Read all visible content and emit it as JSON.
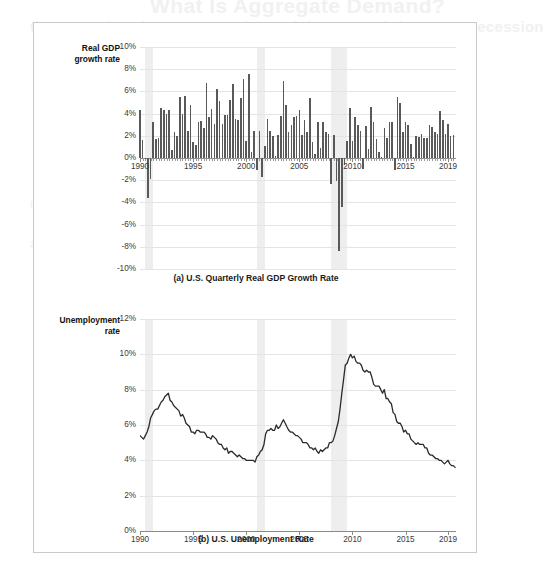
{
  "page": {
    "bleed_through_text": {
      "title": "What Is Aggregate Demand?",
      "line1": "the same drop in aggregate demand that caused the Great Recession",
      "line2": "recession in output and a sharp rise in unemployment",
      "line3": "aggregate demand shifted left during the downturn"
    }
  },
  "figure": {
    "panels": [
      {
        "id": "gdp",
        "caption": "(a) U.S. Quarterly Real GDP Growth Rate",
        "axis_title": "Real GDP\ngrowth rate"
      },
      {
        "id": "unemployment",
        "caption": "(b) U.S. Unemployment Rate",
        "axis_title": "Unemployment\nrate"
      }
    ]
  },
  "colors": {
    "bar": "#595959",
    "line": "#2b2b2b",
    "recession_band": "#eeeeee",
    "gridline": "#e4e4e4",
    "axis": "#8a8a8a",
    "frame_border": "#c9c9c9",
    "background": "#ffffff"
  },
  "chart_data": [
    {
      "type": "bar",
      "id": "gdp",
      "title": "(a) U.S. Quarterly Real GDP Growth Rate",
      "xlabel": "",
      "ylabel": "Real GDP growth rate",
      "ylim": [
        -10,
        10
      ],
      "yticks": [
        10,
        8,
        6,
        4,
        2,
        0,
        -2,
        -4,
        -6,
        -8,
        -10
      ],
      "ytick_labels": [
        "10%",
        "8%",
        "6%",
        "4%",
        "2%",
        "0%",
        "-2%",
        "-4%",
        "-6%",
        "-8%",
        "-10%"
      ],
      "xlim": [
        1990,
        2019.75
      ],
      "xticks": [
        1990,
        1995,
        2000,
        2005,
        2010,
        2015,
        2019
      ],
      "xtick_labels": [
        "1990",
        "1995",
        "2000",
        "2005",
        "2010",
        "2015",
        "2019"
      ],
      "grid": true,
      "legend": "none",
      "unit": "percent, annualized quarterly change",
      "recession_bands": [
        {
          "start": 1990.5,
          "end": 1991.25
        },
        {
          "start": 2001.0,
          "end": 2001.75
        },
        {
          "start": 2007.95,
          "end": 2009.45
        }
      ],
      "x": [
        1990.0,
        1990.25,
        1990.5,
        1990.75,
        1991.0,
        1991.25,
        1991.5,
        1991.75,
        1992.0,
        1992.25,
        1992.5,
        1992.75,
        1993.0,
        1993.25,
        1993.5,
        1993.75,
        1994.0,
        1994.25,
        1994.5,
        1994.75,
        1995.0,
        1995.25,
        1995.5,
        1995.75,
        1996.0,
        1996.25,
        1996.5,
        1996.75,
        1997.0,
        1997.25,
        1997.5,
        1997.75,
        1998.0,
        1998.25,
        1998.5,
        1998.75,
        1999.0,
        1999.25,
        1999.5,
        1999.75,
        2000.0,
        2000.25,
        2000.5,
        2000.75,
        2001.0,
        2001.25,
        2001.5,
        2001.75,
        2002.0,
        2002.25,
        2002.5,
        2002.75,
        2003.0,
        2003.25,
        2003.5,
        2003.75,
        2004.0,
        2004.25,
        2004.5,
        2004.75,
        2005.0,
        2005.25,
        2005.5,
        2005.75,
        2006.0,
        2006.25,
        2006.5,
        2006.75,
        2007.0,
        2007.25,
        2007.5,
        2007.75,
        2008.0,
        2008.25,
        2008.5,
        2008.75,
        2009.0,
        2009.25,
        2009.5,
        2009.75,
        2010.0,
        2010.25,
        2010.5,
        2010.75,
        2011.0,
        2011.25,
        2011.5,
        2011.75,
        2012.0,
        2012.25,
        2012.5,
        2012.75,
        2013.0,
        2013.25,
        2013.5,
        2013.75,
        2014.0,
        2014.25,
        2014.5,
        2014.75,
        2015.0,
        2015.25,
        2015.5,
        2015.75,
        2016.0,
        2016.25,
        2016.5,
        2016.75,
        2017.0,
        2017.25,
        2017.5,
        2017.75,
        2018.0,
        2018.25,
        2018.5,
        2018.75,
        2019.0,
        2019.25,
        2019.5
      ],
      "values": [
        4.3,
        1.6,
        0.0,
        -3.6,
        -1.9,
        3.2,
        1.7,
        1.8,
        4.5,
        4.3,
        4.0,
        4.3,
        0.7,
        2.3,
        2.0,
        5.5,
        4.0,
        5.6,
        2.4,
        4.8,
        1.4,
        1.2,
        3.2,
        3.3,
        2.7,
        6.8,
        3.7,
        4.4,
        3.1,
        6.2,
        5.1,
        3.1,
        3.9,
        3.9,
        5.2,
        6.7,
        3.5,
        3.4,
        5.4,
        7.1,
        1.5,
        7.6,
        0.5,
        2.4,
        -1.1,
        2.4,
        -1.7,
        1.1,
        3.5,
        2.4,
        2.0,
        0.2,
        2.1,
        3.8,
        6.9,
        4.8,
        2.3,
        3.0,
        3.7,
        3.8,
        4.3,
        2.1,
        3.4,
        2.3,
        5.4,
        1.4,
        0.4,
        3.2,
        0.9,
        3.2,
        2.3,
        2.2,
        -2.3,
        2.1,
        -2.1,
        -8.4,
        -4.4,
        -0.6,
        1.5,
        4.5,
        1.5,
        3.7,
        3.0,
        2.4,
        -1.0,
        2.9,
        0.8,
        4.6,
        3.2,
        1.7,
        0.5,
        0.1,
        2.7,
        1.8,
        3.2,
        3.2,
        -1.1,
        5.5,
        5.0,
        2.3,
        3.2,
        3.0,
        1.3,
        0.1,
        2.0,
        1.9,
        2.2,
        1.8,
        1.8,
        3.0,
        2.8,
        2.3,
        2.2,
        4.2,
        3.4,
        2.2,
        3.1,
        2.0,
        2.1
      ]
    },
    {
      "type": "line",
      "id": "unemployment",
      "title": "(b) U.S. Unemployment Rate",
      "xlabel": "",
      "ylabel": "Unemployment rate",
      "ylim": [
        0,
        12
      ],
      "yticks": [
        12,
        10,
        8,
        6,
        4,
        2,
        0
      ],
      "ytick_labels": [
        "12%",
        "10%",
        "8%",
        "6%",
        "4%",
        "2%",
        "0%"
      ],
      "xlim": [
        1990,
        2019.75
      ],
      "xticks": [
        1990,
        1995,
        2000,
        2005,
        2010,
        2015,
        2019
      ],
      "xtick_labels": [
        "1990",
        "1995",
        "2000",
        "2005",
        "2010",
        "2015",
        "2019"
      ],
      "grid": true,
      "legend": "none",
      "unit": "percent, monthly",
      "recession_bands": [
        {
          "start": 1990.5,
          "end": 1991.25
        },
        {
          "start": 2001.0,
          "end": 2001.75
        },
        {
          "start": 2007.95,
          "end": 2009.45
        }
      ],
      "x": [
        1990.0,
        1990.17,
        1990.33,
        1990.5,
        1990.67,
        1990.83,
        1991.0,
        1991.17,
        1991.33,
        1991.5,
        1991.67,
        1991.83,
        1992.0,
        1992.17,
        1992.33,
        1992.5,
        1992.67,
        1992.83,
        1993.0,
        1993.17,
        1993.33,
        1993.5,
        1993.67,
        1993.83,
        1994.0,
        1994.17,
        1994.33,
        1994.5,
        1994.67,
        1994.83,
        1995.0,
        1995.17,
        1995.33,
        1995.5,
        1995.67,
        1995.83,
        1996.0,
        1996.17,
        1996.33,
        1996.5,
        1996.67,
        1996.83,
        1997.0,
        1997.17,
        1997.33,
        1997.5,
        1997.67,
        1997.83,
        1998.0,
        1998.17,
        1998.33,
        1998.5,
        1998.67,
        1998.83,
        1999.0,
        1999.17,
        1999.33,
        1999.5,
        1999.67,
        1999.83,
        2000.0,
        2000.17,
        2000.33,
        2000.5,
        2000.67,
        2000.83,
        2001.0,
        2001.17,
        2001.33,
        2001.5,
        2001.67,
        2001.83,
        2002.0,
        2002.17,
        2002.33,
        2002.5,
        2002.67,
        2002.83,
        2003.0,
        2003.17,
        2003.33,
        2003.5,
        2003.67,
        2003.83,
        2004.0,
        2004.17,
        2004.33,
        2004.5,
        2004.67,
        2004.83,
        2005.0,
        2005.17,
        2005.33,
        2005.5,
        2005.67,
        2005.83,
        2006.0,
        2006.17,
        2006.33,
        2006.5,
        2006.67,
        2006.83,
        2007.0,
        2007.17,
        2007.33,
        2007.5,
        2007.67,
        2007.83,
        2008.0,
        2008.17,
        2008.33,
        2008.5,
        2008.67,
        2008.83,
        2009.0,
        2009.17,
        2009.33,
        2009.5,
        2009.67,
        2009.83,
        2010.0,
        2010.17,
        2010.33,
        2010.5,
        2010.67,
        2010.83,
        2011.0,
        2011.17,
        2011.33,
        2011.5,
        2011.67,
        2011.83,
        2012.0,
        2012.17,
        2012.33,
        2012.5,
        2012.67,
        2012.83,
        2013.0,
        2013.17,
        2013.33,
        2013.5,
        2013.67,
        2013.83,
        2014.0,
        2014.17,
        2014.33,
        2014.5,
        2014.67,
        2014.83,
        2015.0,
        2015.17,
        2015.33,
        2015.5,
        2015.67,
        2015.83,
        2016.0,
        2016.17,
        2016.33,
        2016.5,
        2016.67,
        2016.83,
        2017.0,
        2017.17,
        2017.33,
        2017.5,
        2017.67,
        2017.83,
        2018.0,
        2018.17,
        2018.33,
        2018.5,
        2018.67,
        2018.83,
        2019.0,
        2019.17,
        2019.33,
        2019.5,
        2019.67
      ],
      "values": [
        5.4,
        5.3,
        5.2,
        5.4,
        5.6,
        5.9,
        6.4,
        6.6,
        6.8,
        6.9,
        6.9,
        7.1,
        7.3,
        7.4,
        7.6,
        7.7,
        7.8,
        7.4,
        7.3,
        7.1,
        7.0,
        6.9,
        6.8,
        6.5,
        6.6,
        6.4,
        6.1,
        6.0,
        5.9,
        5.6,
        5.6,
        5.5,
        5.7,
        5.7,
        5.6,
        5.6,
        5.6,
        5.5,
        5.3,
        5.3,
        5.2,
        5.4,
        5.3,
        5.2,
        5.0,
        4.9,
        4.9,
        4.7,
        4.6,
        4.7,
        4.4,
        4.5,
        4.5,
        4.4,
        4.3,
        4.2,
        4.3,
        4.2,
        4.1,
        4.1,
        4.0,
        4.0,
        4.0,
        4.0,
        4.0,
        3.9,
        4.2,
        4.3,
        4.5,
        4.6,
        4.9,
        5.5,
        5.7,
        5.7,
        5.8,
        5.7,
        5.7,
        6.0,
        5.8,
        5.9,
        6.1,
        6.3,
        6.1,
        5.9,
        5.7,
        5.6,
        5.6,
        5.5,
        5.4,
        5.4,
        5.3,
        5.2,
        5.0,
        5.0,
        5.0,
        4.9,
        4.7,
        4.7,
        4.6,
        4.7,
        4.5,
        4.4,
        4.6,
        4.5,
        4.6,
        4.7,
        4.7,
        5.0,
        5.0,
        5.1,
        5.4,
        5.8,
        6.2,
        6.9,
        7.8,
        8.6,
        9.4,
        9.5,
        9.8,
        10.0,
        9.8,
        9.9,
        9.6,
        9.5,
        9.5,
        9.4,
        9.1,
        9.0,
        9.1,
        9.0,
        9.0,
        8.7,
        8.3,
        8.2,
        8.2,
        8.2,
        8.0,
        7.8,
        8.0,
        7.5,
        7.5,
        7.3,
        7.2,
        6.7,
        6.6,
        6.2,
        6.1,
        6.1,
        5.9,
        5.6,
        5.7,
        5.5,
        5.5,
        5.2,
        5.1,
        5.0,
        4.9,
        5.0,
        4.9,
        4.9,
        4.9,
        4.7,
        4.7,
        4.4,
        4.3,
        4.3,
        4.2,
        4.1,
        4.1,
        4.0,
        4.0,
        3.9,
        3.8,
        3.9,
        4.0,
        3.8,
        3.7,
        3.7,
        3.6
      ]
    }
  ]
}
